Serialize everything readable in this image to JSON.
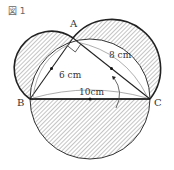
{
  "figure": {
    "title": "図 1",
    "points": {
      "A": {
        "label": "A",
        "x": 73,
        "y": 38
      },
      "B": {
        "label": "B",
        "x": 30,
        "y": 99
      },
      "C": {
        "label": "C",
        "x": 150,
        "y": 99
      }
    },
    "lengths": {
      "AB": "6 cm",
      "AC": "8 cm",
      "BC": "10cm"
    },
    "colors": {
      "stroke": "#222222",
      "thin": "#555555",
      "hatch": "#888888"
    }
  }
}
